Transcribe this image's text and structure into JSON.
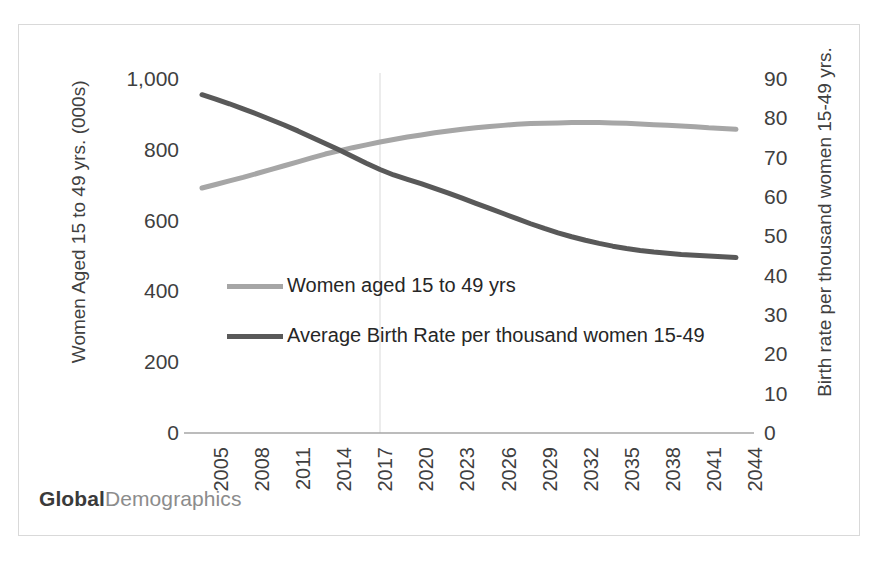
{
  "brand": {
    "strong": "Global",
    "light": "Demographics"
  },
  "chart_data": {
    "type": "line",
    "title": "",
    "xlabel": "",
    "grid": {
      "horizontal": false,
      "vertical_marker_year": 2018
    },
    "legend_position": "inside-center-left",
    "x": [
      2005,
      2006,
      2007,
      2008,
      2009,
      2010,
      2011,
      2012,
      2013,
      2014,
      2015,
      2016,
      2017,
      2018,
      2019,
      2020,
      2021,
      2022,
      2023,
      2024,
      2025,
      2026,
      2027,
      2028,
      2029,
      2030,
      2031,
      2032,
      2033,
      2034,
      2035,
      2036,
      2037,
      2038,
      2039,
      2040,
      2041,
      2042,
      2043,
      2044
    ],
    "tick_labels_x": [
      "2005",
      "2008",
      "2011",
      "2014",
      "2017",
      "2020",
      "2023",
      "2026",
      "2029",
      "2032",
      "2035",
      "2038",
      "2041",
      "2044"
    ],
    "axes": {
      "left": {
        "label": "Women Aged 15 to 49 yrs. (000s)",
        "ticks": [
          "1,000",
          "800",
          "600",
          "400",
          "200",
          "0"
        ],
        "tick_values": [
          1000,
          800,
          600,
          400,
          200,
          0
        ],
        "ylim": [
          0,
          1000
        ]
      },
      "right": {
        "label": "Birth rate per thousand women 15-49 yrs.",
        "ticks": [
          "90",
          "80",
          "70",
          "60",
          "50",
          "40",
          "30",
          "20",
          "10",
          "0"
        ],
        "tick_values": [
          90,
          80,
          70,
          60,
          50,
          40,
          30,
          20,
          10,
          0
        ],
        "ylim": [
          0,
          90
        ]
      }
    },
    "series": [
      {
        "name": "Women aged 15 to 49 yrs",
        "axis": "left",
        "color": "#a6a6a6",
        "values": [
          692,
          702,
          712,
          722,
          733,
          744,
          755,
          766,
          777,
          788,
          797,
          806,
          814,
          822,
          829,
          836,
          842,
          848,
          853,
          858,
          862,
          866,
          869,
          872,
          874,
          875,
          876,
          877,
          877,
          877,
          876,
          875,
          873,
          871,
          869,
          867,
          865,
          862,
          860,
          858
        ]
      },
      {
        "name": "Average Birth Rate per thousand women 15-49",
        "axis": "right",
        "color": "#595959",
        "values": [
          86.0,
          84.9,
          83.7,
          82.4,
          81.1,
          79.7,
          78.3,
          76.8,
          75.2,
          73.6,
          72.0,
          70.3,
          68.6,
          67.0,
          65.6,
          64.5,
          63.4,
          62.2,
          61.0,
          59.7,
          58.4,
          57.1,
          55.8,
          54.5,
          53.2,
          52.0,
          50.9,
          49.9,
          49.0,
          48.2,
          47.5,
          46.9,
          46.4,
          46.0,
          45.7,
          45.4,
          45.2,
          45.0,
          44.8,
          44.6
        ]
      }
    ]
  }
}
